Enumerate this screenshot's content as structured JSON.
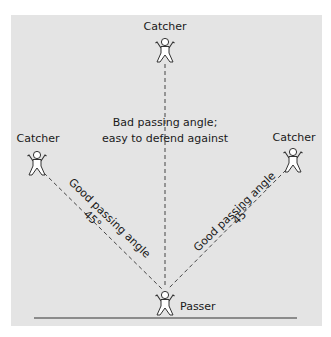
{
  "diagram": {
    "type": "passing-angles",
    "colors": {
      "background": "#e4e4e4",
      "line": "#333333",
      "figure_fill": "#ffffff",
      "text": "#1a1a1a"
    },
    "players": {
      "top_catcher": {
        "label": "Catcher"
      },
      "left_catcher": {
        "label": "Catcher"
      },
      "right_catcher": {
        "label": "Catcher"
      },
      "passer": {
        "label": "Passer"
      }
    },
    "annotations": {
      "bad_line1": "Bad passing angle;",
      "bad_line2": "easy to defend against",
      "good_left": "Good passing angle",
      "good_right": "Good passing angle",
      "angle_left": "45°",
      "angle_right": "45°"
    }
  }
}
